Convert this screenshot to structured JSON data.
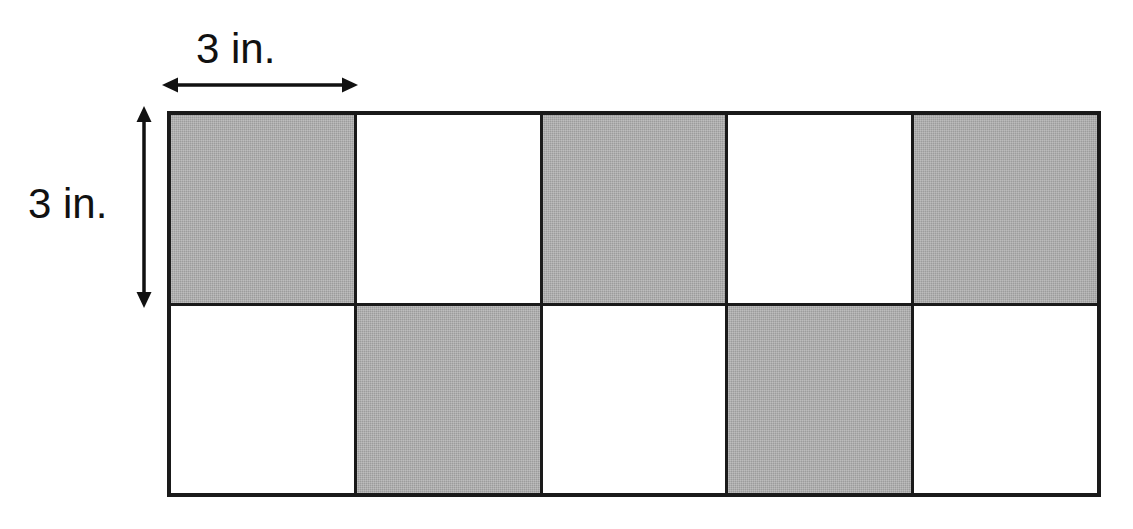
{
  "figure": {
    "type": "checkerboard-tiled-rectangle",
    "rows": 2,
    "columns": 5,
    "total_tiles": 10,
    "shaded_tiles": 5,
    "unshaded_tiles": 5,
    "tile_side_label": "3 in.",
    "colors": {
      "shaded": "#9c9c9c",
      "unshaded": "#ffffff",
      "outline": "#1a1a1a"
    },
    "tiles": [
      [
        {
          "index": 1,
          "fill": "gray",
          "row": 1,
          "col": 1
        },
        {
          "index": 2,
          "fill": "white",
          "row": 1,
          "col": 2
        },
        {
          "index": 3,
          "fill": "gray",
          "row": 1,
          "col": 3
        },
        {
          "index": 4,
          "fill": "white",
          "row": 1,
          "col": 4
        },
        {
          "index": 5,
          "fill": "gray",
          "row": 1,
          "col": 5
        }
      ],
      [
        {
          "index": 6,
          "fill": "white",
          "row": 2,
          "col": 1
        },
        {
          "index": 7,
          "fill": "gray",
          "row": 2,
          "col": 2
        },
        {
          "index": 8,
          "fill": "white",
          "row": 2,
          "col": 3
        },
        {
          "index": 9,
          "fill": "gray",
          "row": 2,
          "col": 4
        },
        {
          "index": 10,
          "fill": "white",
          "row": 2,
          "col": 5
        }
      ]
    ]
  },
  "dimensions": {
    "width_label": "3 in.",
    "height_label": "3 in.",
    "width_measure_description": "double-headed horizontal arrow spanning the top-left tile width",
    "height_measure_description": "double-headed vertical arrow spanning the top-left tile height"
  },
  "artifacts": {
    "ghost_line_1": "",
    "ghost_line_2": ""
  }
}
